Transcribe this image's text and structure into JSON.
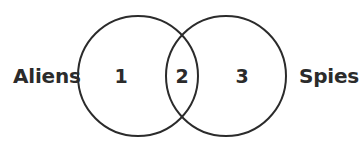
{
  "figure": {
    "type": "venn-diagram",
    "width": 357,
    "height": 153,
    "background_color": "#ffffff",
    "stroke_color": "#2b2b2b",
    "stroke_width": 2,
    "text_color": "#2b2b2b"
  },
  "sets": {
    "left": {
      "label": "Aliens",
      "center_x": 138,
      "center_y": 76,
      "radius": 60
    },
    "right": {
      "label": "Spies",
      "center_x": 226,
      "center_y": 76,
      "radius": 60
    }
  },
  "regions": {
    "left_only": "1",
    "intersection": "2",
    "right_only": "3"
  },
  "chart_data": {
    "type": "venn",
    "title": "",
    "categories": [
      "Aliens",
      "Spies"
    ],
    "regions": [
      {
        "id": "left_only",
        "sets": [
          "Aliens"
        ],
        "label": "1",
        "value": 1
      },
      {
        "id": "intersection",
        "sets": [
          "Aliens",
          "Spies"
        ],
        "label": "2",
        "value": 2
      },
      {
        "id": "right_only",
        "sets": [
          "Spies"
        ],
        "label": "3",
        "value": 3
      }
    ],
    "legend": "none",
    "grid": false
  }
}
